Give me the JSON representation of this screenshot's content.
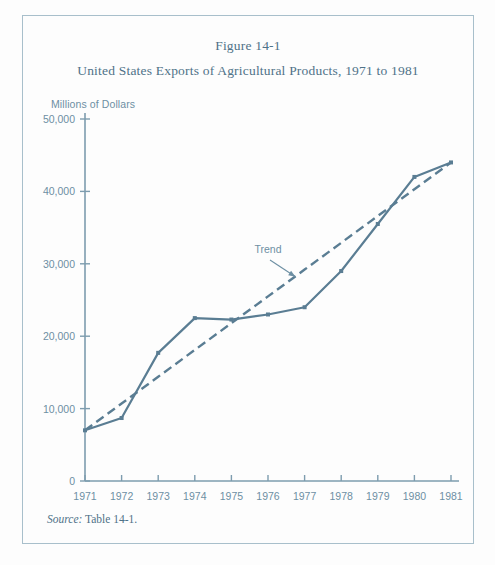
{
  "figure": {
    "number": "Figure 14-1",
    "title": "United States Exports of Agricultural Products, 1971 to 1981",
    "unit_label": "Millions of Dollars",
    "source_label": "Source:",
    "source_value": "Table 14-1."
  },
  "colors": {
    "line": "#5a7d93",
    "text": "#4f7288",
    "axis": "#7d9cae",
    "frame": "#a8bfcb",
    "background": "#fdfdfd"
  },
  "chart_data": {
    "type": "line",
    "title": "United States Exports of Agricultural Products, 1971 to 1981",
    "subtitle": "Figure 14-1",
    "xlabel": "",
    "ylabel": "Millions of Dollars",
    "categories": [
      "1971",
      "1972",
      "1973",
      "1974",
      "1975",
      "1976",
      "1977",
      "1978",
      "1979",
      "1980",
      "1981"
    ],
    "x": [
      1971,
      1972,
      1973,
      1974,
      1975,
      1976,
      1977,
      1978,
      1979,
      1980,
      1981
    ],
    "xlim": [
      1971,
      1981
    ],
    "ylim": [
      0,
      50000
    ],
    "yticks": [
      0,
      10000,
      20000,
      30000,
      40000,
      50000
    ],
    "ytick_labels": [
      "0",
      "10,000",
      "20,000",
      "30,000",
      "40,000",
      "50,000"
    ],
    "xtick_labels": [
      "1971",
      "1972",
      "1973",
      "1974",
      "1975",
      "1976",
      "1977",
      "1978",
      "1979",
      "1980",
      "1981"
    ],
    "grid": false,
    "legend": false,
    "series": [
      {
        "name": "Exports",
        "style": "solid",
        "markers": true,
        "values": [
          7000,
          8700,
          17700,
          22500,
          22300,
          23000,
          24000,
          29000,
          35500,
          42000,
          44000
        ]
      },
      {
        "name": "Trend",
        "style": "dashed",
        "markers": false,
        "values": [
          7000,
          10700,
          14400,
          18100,
          21800,
          25500,
          29200,
          32900,
          36600,
          40300,
          44000
        ]
      }
    ],
    "annotations": [
      {
        "text": "Trend",
        "x": 1976.0,
        "y": 31500,
        "arrow_to_x": 1976.75,
        "arrow_to_y": 28200
      }
    ]
  }
}
